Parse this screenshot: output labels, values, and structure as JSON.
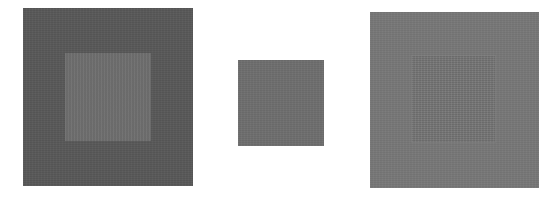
{
  "figure": {
    "background_color": "#ffffff",
    "panels": [
      {
        "id": "left",
        "outer_color": "#585858",
        "inner_color": "#6e6e6e"
      },
      {
        "id": "middle",
        "outer_color": "#ffffff",
        "inner_color": "#6e6e6e"
      },
      {
        "id": "right",
        "outer_color": "#777777",
        "inner_color": "#747474"
      }
    ]
  }
}
